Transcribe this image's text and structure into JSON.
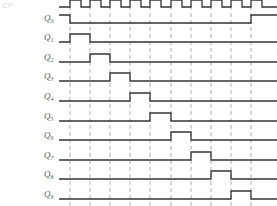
{
  "caption_fragment": "CP",
  "timing": {
    "x_start": 59,
    "period": 20,
    "edges_x": [
      70,
      90,
      110,
      130,
      150,
      171,
      191,
      211,
      231,
      251
    ],
    "x_end": 277,
    "clock": {
      "name": "CP",
      "y_high": 0,
      "y_low": 7
    },
    "signals": [
      {
        "name": "Q",
        "sub": "0",
        "y_low": 23,
        "high_intervals": [
          [
            59,
            70
          ],
          [
            251,
            277
          ]
        ]
      },
      {
        "name": "Q",
        "sub": "1",
        "y_low": 42,
        "high_intervals": [
          [
            70,
            90
          ]
        ]
      },
      {
        "name": "Q",
        "sub": "2",
        "y_low": 62,
        "high_intervals": [
          [
            90,
            110
          ]
        ]
      },
      {
        "name": "Q",
        "sub": "3",
        "y_low": 81,
        "high_intervals": [
          [
            110,
            130
          ]
        ]
      },
      {
        "name": "Q",
        "sub": "4",
        "y_low": 101,
        "high_intervals": [
          [
            130,
            150
          ]
        ]
      },
      {
        "name": "Q",
        "sub": "5",
        "y_low": 121,
        "high_intervals": [
          [
            150,
            171
          ]
        ]
      },
      {
        "name": "Q",
        "sub": "6",
        "y_low": 140,
        "high_intervals": [
          [
            171,
            191
          ]
        ]
      },
      {
        "name": "Q",
        "sub": "7",
        "y_low": 160,
        "high_intervals": [
          [
            191,
            211
          ]
        ]
      },
      {
        "name": "Q",
        "sub": "8",
        "y_low": 179,
        "high_intervals": [
          [
            211,
            231
          ]
        ]
      },
      {
        "name": "Q",
        "sub": "9",
        "y_low": 199,
        "high_intervals": [
          [
            231,
            251
          ]
        ]
      }
    ],
    "pulse_height": 8
  }
}
